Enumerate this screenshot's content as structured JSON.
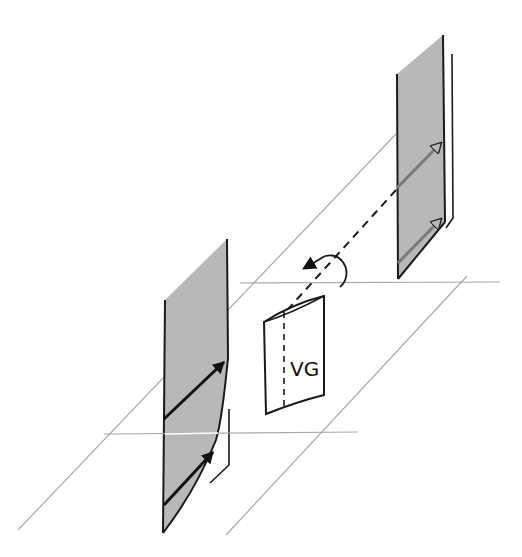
{
  "diagram": {
    "type": "schematic-3d-flow",
    "labels": {
      "vortex_generator": "VG"
    },
    "elements": [
      {
        "name": "upstream-panel",
        "description": "Shaded vertical plate (right/back) with two hollow-head arrows indicating flow vectors"
      },
      {
        "name": "downstream-panel",
        "description": "Shaded vertical plate (left/front) with two filled-head arrows; right edge curved near bottom"
      },
      {
        "name": "vortex-generator",
        "description": "Curved rectangular vane labelled VG with dashed centre line"
      },
      {
        "name": "vortex-axis",
        "description": "Dashed line from upstream panel toward VG"
      },
      {
        "name": "rotation-arrow",
        "description": "Circular arrow around dashed axis indicating swirl direction"
      },
      {
        "name": "ground-plane",
        "description": "Thin gray reference lines forming a perspective plane"
      }
    ],
    "colors": {
      "panel_fill": "#b8b8b8",
      "outline": "#1a1a1a",
      "guide_line": "#a8a8a8",
      "upstream_arrow": "#7a7a7a",
      "downstream_arrow": "#111111",
      "background": "#ffffff"
    }
  }
}
